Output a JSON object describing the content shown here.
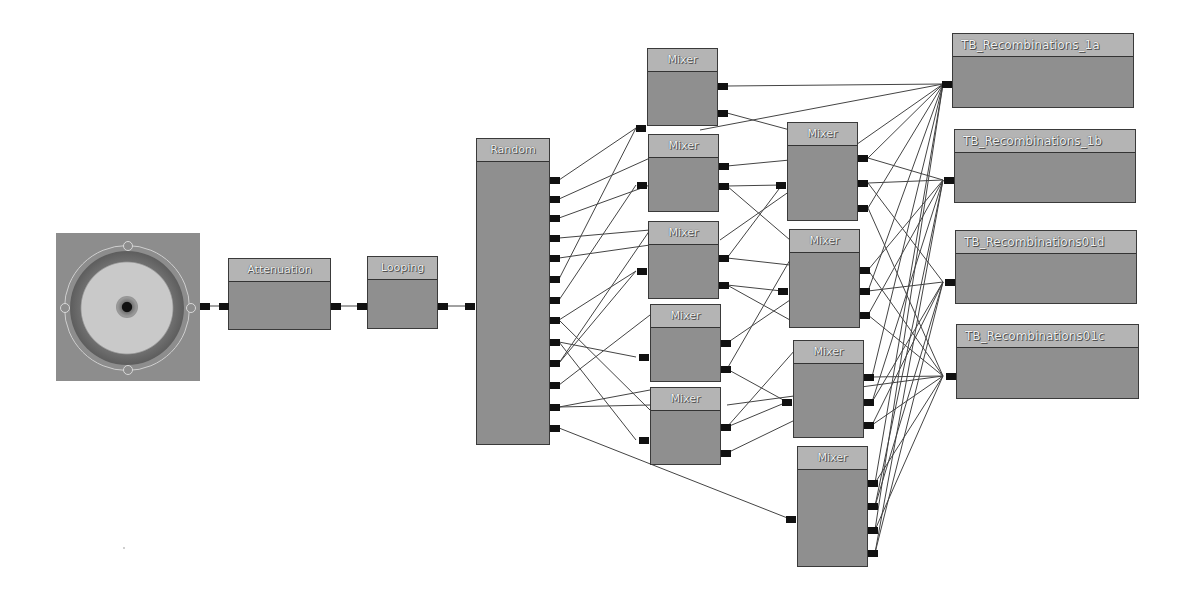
{
  "graph": {
    "source": {
      "label": "",
      "icon": "speaker-icon"
    },
    "nodes": {
      "attenuation": {
        "title": "Attenuation"
      },
      "looping": {
        "title": "Looping"
      },
      "random": {
        "title": "Random",
        "output_count": 13
      },
      "mixers_col1": [
        {
          "title": "Mixer"
        },
        {
          "title": "Mixer"
        },
        {
          "title": "Mixer"
        },
        {
          "title": "Mixer"
        },
        {
          "title": "Mixer"
        }
      ],
      "mixers_col2": [
        {
          "title": "Mixer",
          "inputs": 3
        },
        {
          "title": "Mixer",
          "inputs": 3
        },
        {
          "title": "Mixer",
          "inputs": 3
        },
        {
          "title": "Mixer",
          "inputs": 4
        }
      ],
      "waves": [
        {
          "title": "TB_Recombinations_1a"
        },
        {
          "title": "TB_Recombinations_1b"
        },
        {
          "title": "TB_Recombinations01d"
        },
        {
          "title": "TB_Recombinations01c"
        }
      ]
    },
    "colors": {
      "background": "#ffffff",
      "node_body": "#8f8f8f",
      "node_title": "#b4b4b4",
      "pin": "#111111",
      "wire": "#444444"
    }
  }
}
